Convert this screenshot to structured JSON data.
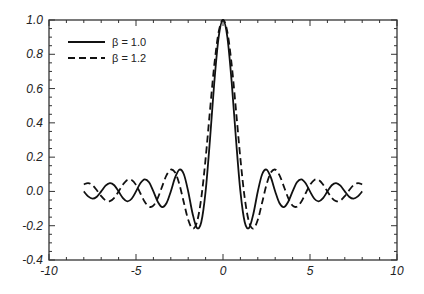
{
  "chart_data": {
    "type": "line",
    "title": "",
    "xlabel": "",
    "ylabel": "",
    "xlim": [
      -10,
      10
    ],
    "ylim": [
      -0.4,
      1.0
    ],
    "grid": false,
    "legend_position": "upper left",
    "xticks": [
      -10,
      -5,
      0,
      5,
      10
    ],
    "xtick_labels": [
      "-10",
      "-5",
      "0",
      "5",
      "10"
    ],
    "yticks": [
      -0.4,
      -0.2,
      0.0,
      0.2,
      0.4,
      0.6,
      0.8,
      1.0
    ],
    "ytick_labels": [
      "-0.4",
      "-0.2",
      "0.0",
      "0.2",
      "0.4",
      "0.6",
      "0.8",
      "1.0"
    ],
    "x_half": [
      0,
      0.25,
      0.5,
      0.75,
      1,
      1.25,
      1.5,
      1.75,
      2,
      2.25,
      2.5,
      2.75,
      3,
      3.25,
      3.5,
      3.75,
      4,
      4.25,
      4.5,
      4.75,
      5,
      5.25,
      5.5,
      5.75,
      6,
      6.25,
      6.5,
      6.75,
      7,
      7.25,
      7.5,
      7.75,
      8
    ],
    "symmetric": true,
    "series": [
      {
        "name": "β = 1.0",
        "style": "solid",
        "values": [
          1,
          0.9003,
          0.6366,
          0.3001,
          0,
          -0.1801,
          -0.2122,
          -0.1286,
          0,
          0.1,
          0.1273,
          0.0818,
          0,
          -0.0693,
          -0.0909,
          -0.06,
          0,
          0.053,
          0.0707,
          0.0474,
          0,
          -0.0429,
          -0.0579,
          -0.0391,
          0,
          0.036,
          0.049,
          0.0333,
          0,
          -0.031,
          -0.0424,
          -0.029,
          0
        ]
      },
      {
        "name": "β = 1.2",
        "style": "dashed",
        "values": [
          1,
          0.9302,
          0.7379,
          0.4705,
          0.191,
          -0.0399,
          -0.1801,
          -0.2164,
          -0.1654,
          -0.065,
          0.0395,
          0.1102,
          0.1273,
          0.0932,
          0.0282,
          -0.039,
          -0.0827,
          -0.0891,
          -0.06,
          -0.0105,
          0.0382,
          0.0672,
          0.0671,
          0.0404,
          0,
          -0.0372,
          -0.0568,
          -0.0523,
          -0.0273,
          0.0069,
          0.036,
          0.0489,
          0.0413
        ]
      }
    ]
  },
  "legend": {
    "items": [
      {
        "label": "β = 1.0",
        "style": "solid"
      },
      {
        "label": "β = 1.2",
        "style": "dashed"
      }
    ]
  },
  "colors": {
    "line": "#111111",
    "axis": "#333333",
    "background": "#ffffff"
  }
}
